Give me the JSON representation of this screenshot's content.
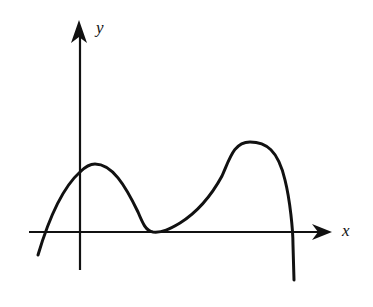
{
  "diagram": {
    "type": "function-sketch",
    "axes": {
      "x_label": "x",
      "y_label": "y",
      "origin_px": [
        80,
        232
      ],
      "x_axis": {
        "from_px": [
          29,
          232
        ],
        "to_px": [
          332,
          232
        ],
        "arrow": true
      },
      "y_axis": {
        "from_px": [
          80,
          270
        ],
        "to_px": [
          80,
          22
        ],
        "arrow": true
      }
    },
    "curve": {
      "description": "Polynomial-like curve: rises from below x-axis, crosses x-axis left of origin, crosses y-axis above origin, local maximum just right of y-axis, decreases to touch x-axis tangentially (double root), rises to a larger local maximum, then falls steeply crossing x-axis and going down.",
      "key_points_px": {
        "start": [
          38,
          255
        ],
        "left_root": [
          47,
          232
        ],
        "y_intercept": [
          80,
          172
        ],
        "local_max_1": [
          93,
          164
        ],
        "double_root": [
          153,
          232
        ],
        "local_max_2": [
          250,
          142
        ],
        "right_root": [
          292,
          232
        ],
        "end": [
          294,
          280
        ]
      }
    },
    "stroke_color": "#111111",
    "background": "#ffffff"
  }
}
